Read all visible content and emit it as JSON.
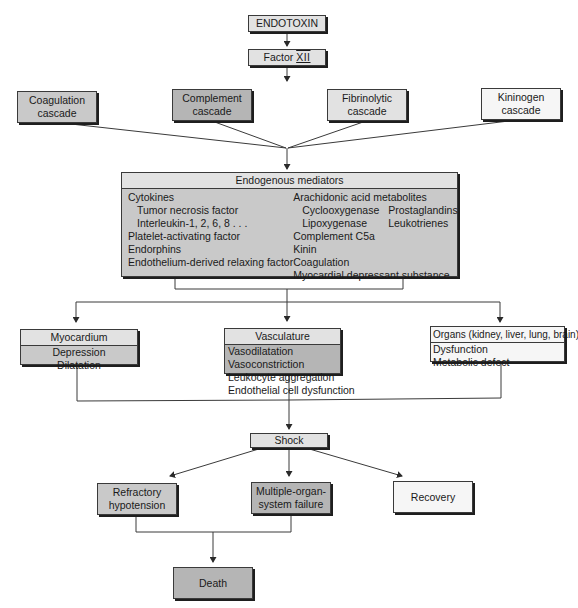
{
  "diagram": {
    "top": {
      "endotoxin": "ENDOTOXIN",
      "factor_prefix": "Factor ",
      "factor_roman": "XII"
    },
    "cascades": [
      {
        "line1": "Coagulation",
        "line2": "cascade"
      },
      {
        "line1": "Complement",
        "line2": "cascade"
      },
      {
        "line1": "Fibrinolytic",
        "line2": "cascade"
      },
      {
        "line1": "Kininogen",
        "line2": "cascade"
      }
    ],
    "mediators": {
      "title": "Endogenous mediators",
      "left": [
        {
          "text": "Cytokines",
          "indent": 0
        },
        {
          "text": "Tumor necrosis factor",
          "indent": 1
        },
        {
          "text": "Interleukin-1, 2, 6, 8 . . .",
          "indent": 1
        },
        {
          "text": "Platelet-activating factor",
          "indent": 0
        },
        {
          "text": "Endorphins",
          "indent": 0
        },
        {
          "text": "Endothelium-derived relaxing factor",
          "indent": 0
        }
      ],
      "right": {
        "arachidonic": "Arachidonic acid metabolites",
        "cyclooxygenase": "Cyclooxygenase",
        "prostaglandins": "Prostaglandins",
        "lipoxygenase": "Lipoxygenase",
        "leukotrienes": "Leukotrienes",
        "complement_c5a": "Complement C5a",
        "kinin": "Kinin",
        "coagulation": "Coagulation",
        "mds": "Myocardial depressant substance"
      }
    },
    "targets": {
      "myocardium": {
        "title": "Myocardium",
        "items": [
          "Depression",
          "Dilatation"
        ]
      },
      "vasculature": {
        "title": "Vasculature",
        "items": [
          "Vasodilatation",
          "Vasoconstriction",
          "Leukocyte aggregation",
          "Endothelial cell dysfunction"
        ]
      },
      "organs": {
        "title": "Organs (kidney, liver, lung, brain)",
        "items": [
          "Dysfunction",
          "Metabolic defect"
        ]
      }
    },
    "shock": "Shock",
    "outcomes": {
      "refractory": {
        "line1": "Refractory",
        "line2": "hypotension"
      },
      "mosf": {
        "line1": "Multiple-organ-",
        "line2": "system failure"
      },
      "recovery": "Recovery"
    },
    "death": "Death",
    "colors": {
      "box_light": "#e2e2e2",
      "box_mid": "#c9c9c9",
      "box_dark": "#b5b5b5",
      "box_white": "#f6f6f6",
      "line": "#3a3a3a"
    }
  }
}
